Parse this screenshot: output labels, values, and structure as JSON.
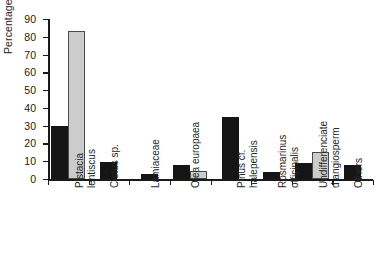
{
  "chart_data": {
    "type": "bar",
    "title": "",
    "xlabel": "",
    "ylabel": "Percentages (%)",
    "ylim": [
      0,
      90
    ],
    "ytick_step": 10,
    "yticks": [
      90,
      80,
      70,
      60,
      50,
      40,
      30,
      20,
      10,
      0
    ],
    "ytick_labels": [
      "90",
      "80",
      "70",
      "60",
      "50",
      "40",
      "30",
      "20",
      "10",
      "0"
    ],
    "grid": false,
    "legend": "none",
    "categories": [
      "Pistacia\nlentiscus",
      "Cistus sp.",
      "Lamiaceae",
      "Olea europaea",
      "Pinus cf.\nhalepensis",
      "Rosmarinus\nofficinalis",
      "Undifferenciate\nd angiosperm",
      "Others"
    ],
    "series": [
      {
        "name": "series-1-black",
        "color": "#151515",
        "values": [
          30,
          9.5,
          2.7,
          8,
          35,
          4,
          9,
          8
        ]
      },
      {
        "name": "series-2-grey",
        "color": "#cccccc",
        "values": [
          83,
          null,
          null,
          4.5,
          null,
          null,
          15,
          null
        ]
      }
    ]
  },
  "figure": {
    "clipped_caption": ""
  }
}
